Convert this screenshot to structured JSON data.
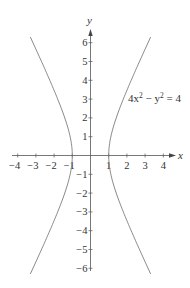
{
  "chart_data": {
    "type": "line",
    "title": "",
    "equation": "4x^2 - y^2 = 4",
    "curve_label": {
      "prefix": "4x",
      "exp1": "2",
      "mid": " − y",
      "exp2": "2",
      "suffix": " = 4"
    },
    "xlabel": "x",
    "ylabel": "y",
    "xlim": [
      -4.3,
      4.5
    ],
    "ylim": [
      -6.3,
      6.6
    ],
    "x_ticks": [
      -4,
      -3,
      -2,
      -1,
      1,
      2,
      3,
      4
    ],
    "x_tick_labels": [
      "−4",
      "−3",
      "−2",
      "−1",
      "1",
      "2",
      "3",
      "4"
    ],
    "y_ticks": [
      6,
      5,
      4,
      3,
      2,
      1,
      -1,
      -2,
      -3,
      -4,
      -5,
      -6
    ],
    "y_tick_labels": [
      "6",
      "5",
      "4",
      "3",
      "2",
      "1",
      "−1",
      "−2",
      "−3",
      "−4",
      "−5",
      "−6"
    ],
    "grid": false,
    "legend": "none",
    "series": [
      {
        "name": "right branch",
        "x": [
          3.3,
          2.83,
          2.5,
          2.24,
          1.8,
          1.41,
          1.12,
          1.0,
          1.12,
          1.41,
          1.8,
          2.24,
          2.5,
          2.83,
          3.3
        ],
        "y": [
          6.3,
          5.29,
          4.58,
          4,
          3,
          2,
          1,
          0,
          -1,
          -2,
          -3,
          -4,
          -4.58,
          -5.29,
          -6.3
        ]
      },
      {
        "name": "left branch",
        "x": [
          -3.3,
          -2.83,
          -2.5,
          -2.24,
          -1.8,
          -1.41,
          -1.12,
          -1.0,
          -1.12,
          -1.41,
          -1.8,
          -2.24,
          -2.5,
          -2.83,
          -3.3
        ],
        "y": [
          6.3,
          5.29,
          4.58,
          4,
          3,
          2,
          1,
          0,
          -1,
          -2,
          -3,
          -4,
          -4.58,
          -5.29,
          -6.3
        ]
      }
    ],
    "colors": {
      "curve": "#7a7a7a",
      "axis": "#555555",
      "text": "#333333"
    }
  }
}
